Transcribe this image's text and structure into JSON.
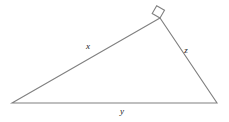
{
  "figure": {
    "type": "right-triangle-diagram",
    "background_color": "#ffffff",
    "stroke_color": "#808080",
    "label_color": "#1a1a1a",
    "stroke_width": 1.1,
    "width": 229,
    "height": 122
  },
  "vertices": {
    "left": {
      "name": "left-vertex",
      "x": 12,
      "y": 103
    },
    "apex": {
      "name": "apex-vertex",
      "x": 160,
      "y": 18
    },
    "right": {
      "name": "right-vertex",
      "x": 217,
      "y": 103
    }
  },
  "right_angle": {
    "at_vertex": "apex",
    "marker": "square",
    "size": 9,
    "points": "160,18 152.2,13.5 156.7,5.7 164.5,10.2"
  },
  "sides": [
    {
      "name": "side-x",
      "label": "x",
      "from": "left",
      "to": "apex",
      "label_x": 88,
      "label_y": 46
    },
    {
      "name": "side-z",
      "label": "z",
      "from": "apex",
      "to": "right",
      "label_x": 186,
      "label_y": 50
    },
    {
      "name": "side-y",
      "label": "y",
      "from": "left",
      "to": "right",
      "label_x": 122,
      "label_y": 111
    }
  ],
  "polygon_points": "12,103 160,18 217,103"
}
